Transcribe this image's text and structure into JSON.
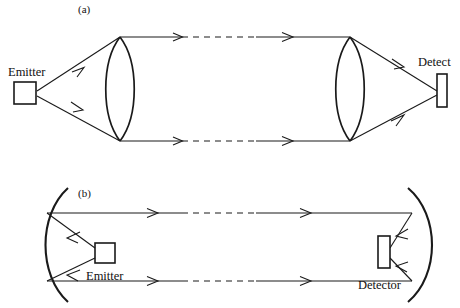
{
  "figure": {
    "type": "optics-ray-diagram",
    "background": "#ffffff",
    "stroke_color": "#1a1a1a",
    "panels": [
      {
        "id": "a",
        "label": "(a)",
        "label_x": 78,
        "label_y": 13,
        "description": "Refractive configuration: emitter, biconvex collimating lens, collimated beam, biconvex focusing lens, detector",
        "source": {
          "name": "Emitter",
          "label": "Emitter",
          "label_x": 8,
          "label_y": 76,
          "shape": "square"
        },
        "sink": {
          "name": "Detect",
          "label": "Detect",
          "label_x": 418,
          "label_y": 66,
          "shape": "tall-rectangle"
        },
        "optics": "lens"
      },
      {
        "id": "b",
        "label": "(b)",
        "label_x": 78,
        "label_y": 197,
        "description": "Reflective configuration: emitter at focus of concave mirror, collimated beam, concave mirror focusing onto detector",
        "source": {
          "name": "Emitter",
          "label": "Emitter",
          "label_x": 86,
          "label_y": 272,
          "shape": "square"
        },
        "sink": {
          "name": "Detector",
          "label": "Detector",
          "label_x": 358,
          "label_y": 289,
          "shape": "tall-rectangle"
        },
        "optics": "concave-mirror"
      }
    ],
    "beam": {
      "style": "solid-dashed-solid",
      "arrow_count_per_ray": 2,
      "dash_pattern": "6 5"
    }
  }
}
